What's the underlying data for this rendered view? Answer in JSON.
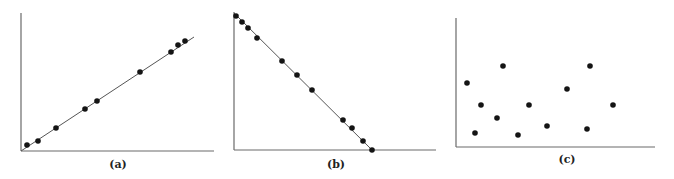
{
  "figure": {
    "panels": [
      {
        "id": "a",
        "caption": "(a)",
        "description": "Strong positive linear correlation"
      },
      {
        "id": "b",
        "caption": "(b)",
        "description": "Strong negative linear correlation"
      },
      {
        "id": "c",
        "caption": "(c)",
        "description": "No correlation"
      }
    ]
  },
  "colors": {
    "axis": "#6a6a6a",
    "line": "#555555",
    "points": "#141414"
  },
  "chart_data": [
    {
      "type": "scatter",
      "title": "(a)",
      "xlabel": "",
      "ylabel": "",
      "grid": false,
      "fit_line": {
        "x": [
          0,
          10
        ],
        "y": [
          0,
          6.6
        ]
      },
      "x": [
        0.35,
        0.98,
        2.02,
        3.7,
        4.39,
        6.88,
        8.67,
        9.08,
        9.48
      ],
      "y": [
        0.33,
        0.6,
        1.34,
        2.45,
        2.9,
        4.58,
        5.73,
        6.14,
        6.37
      ]
    },
    {
      "type": "scatter",
      "title": "(b)",
      "xlabel": "",
      "ylabel": "",
      "grid": false,
      "fit_line": {
        "x": [
          0,
          10
        ],
        "y": [
          10,
          0
        ]
      },
      "x": [
        0.1,
        0.4,
        0.7,
        1.1,
        2.4,
        3.1,
        3.9,
        5.4,
        5.9,
        6.4,
        6.9
      ],
      "y": [
        9.7,
        9.3,
        8.9,
        8.2,
        6.5,
        5.5,
        4.4,
        2.2,
        1.6,
        0.7,
        0.0
      ]
    },
    {
      "type": "scatter",
      "title": "(c)",
      "xlabel": "",
      "ylabel": "",
      "grid": false,
      "x": [
        0.6,
        1.3,
        1.0,
        2.4,
        2.1,
        3.1,
        3.7,
        4.6,
        5.6,
        6.6,
        6.7,
        7.9
      ],
      "y": [
        4.9,
        3.3,
        1.1,
        6.2,
        2.2,
        0.9,
        3.2,
        1.6,
        4.4,
        1.4,
        6.2,
        3.3
      ]
    }
  ],
  "render": {
    "a": {
      "axes": {
        "x0": 21,
        "y0": 151,
        "xTop": 13,
        "xEnd": 214
      },
      "line": [
        21,
        151,
        194,
        37
      ],
      "points": [
        [
          27,
          145
        ],
        [
          38,
          141
        ],
        [
          56,
          128
        ],
        [
          85,
          109
        ],
        [
          97,
          101
        ],
        [
          140,
          72
        ],
        [
          171,
          52
        ],
        [
          178,
          45
        ],
        [
          185,
          41
        ]
      ],
      "label_pos": [
        118,
        168
      ]
    },
    "b": {
      "axes": {
        "x0": 234,
        "y0": 150,
        "xTop": 12,
        "xEnd": 436
      },
      "line": [
        234,
        13,
        372,
        150
      ],
      "points": [
        [
          236,
          16
        ],
        [
          242,
          22
        ],
        [
          248,
          28
        ],
        [
          257,
          38
        ],
        [
          282,
          61
        ],
        [
          297,
          75
        ],
        [
          312,
          90
        ],
        [
          343,
          120
        ],
        [
          352,
          128
        ],
        [
          363,
          141
        ],
        [
          372,
          150
        ]
      ],
      "label_pos": [
        336,
        168
      ]
    },
    "c": {
      "axes": {
        "x0": 456,
        "y0": 147,
        "xTop": 18,
        "xEnd": 655
      },
      "points": [
        [
          467,
          83
        ],
        [
          481,
          105
        ],
        [
          475,
          133
        ],
        [
          503,
          66
        ],
        [
          497,
          118
        ],
        [
          518,
          135
        ],
        [
          529,
          105
        ],
        [
          547,
          126
        ],
        [
          567,
          89
        ],
        [
          587,
          129
        ],
        [
          590,
          66
        ],
        [
          613,
          105
        ]
      ],
      "label_pos": [
        567,
        163
      ]
    }
  }
}
